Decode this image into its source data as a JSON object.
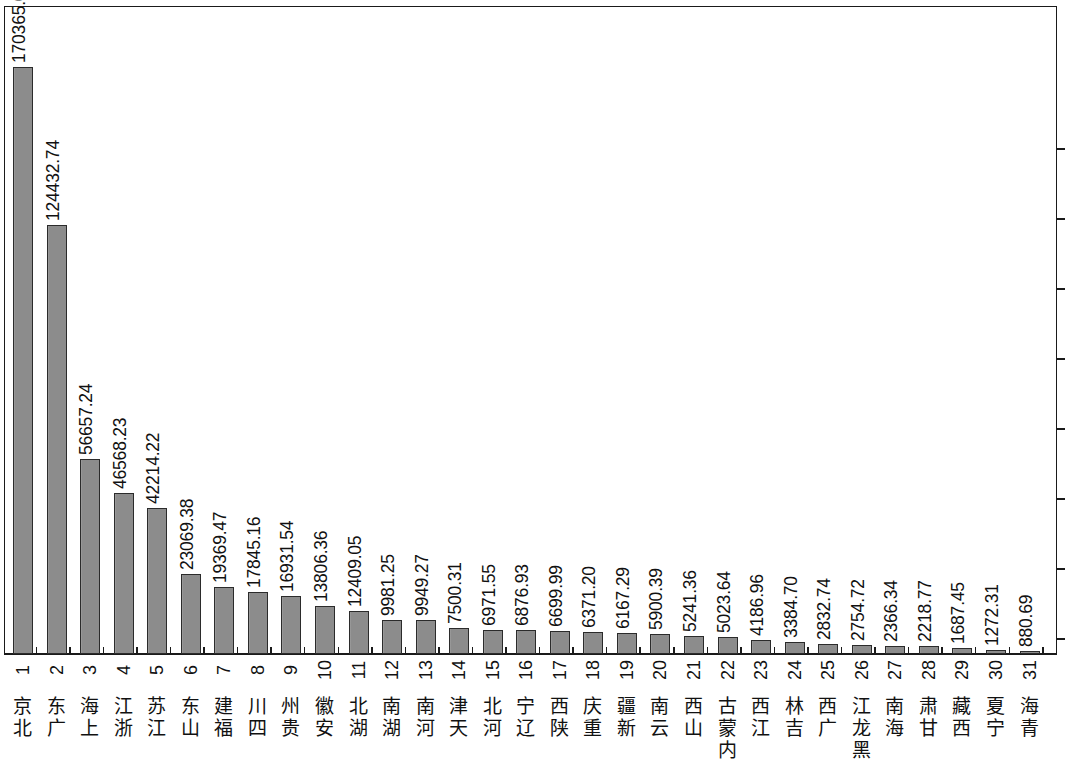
{
  "chart_data": {
    "type": "bar",
    "title": "",
    "subtitle": "",
    "xlabel": "",
    "ylabel": "",
    "grid": false,
    "legend": null,
    "orientation": "vertical",
    "value_label_rotation": -90,
    "x_tick_label_rotation": -90,
    "ylim": [
      0,
      181000
    ],
    "bar_color": "#8c8c8c",
    "bar_edge_color": "#2b2b2b",
    "axis_color": "#1a1a1a",
    "indices": [
      1,
      2,
      3,
      4,
      5,
      6,
      7,
      8,
      9,
      10,
      11,
      12,
      13,
      14,
      15,
      16,
      17,
      18,
      19,
      20,
      21,
      22,
      23,
      24,
      25,
      26,
      27,
      28,
      29,
      30,
      31
    ],
    "categories": [
      "北京",
      "广东",
      "上海",
      "浙江",
      "江苏",
      "山东",
      "福建",
      "四川",
      "贵州",
      "安徽",
      "湖北",
      "湖南",
      "河南",
      "天津",
      "河北",
      "辽宁",
      "陕西",
      "重庆",
      "新疆",
      "云南",
      "山西",
      "内蒙古",
      "江西",
      "吉林",
      "广西",
      "黑龙江",
      "海南",
      "甘肃",
      "西藏",
      "宁夏",
      "青海"
    ],
    "values": [
      170365.02,
      124432.74,
      56657.24,
      46568.23,
      42214.22,
      23069.38,
      19369.47,
      17845.16,
      16931.54,
      13806.36,
      12409.05,
      9981.25,
      9949.27,
      7500.31,
      6971.55,
      6876.93,
      6699.99,
      6371.2,
      6167.29,
      5900.39,
      5241.36,
      5023.64,
      4186.96,
      3384.7,
      2832.74,
      2754.72,
      2366.34,
      2218.77,
      1687.45,
      1272.31,
      880.69
    ],
    "value_labels": [
      "170365.02",
      "124432.74",
      "56657.24",
      "46568.23",
      "42214.22",
      "23069.38",
      "19369.47",
      "17845.16",
      "16931.54",
      "13806.36",
      "12409.05",
      "9981.25",
      "9949.27",
      "7500.31",
      "6971.55",
      "6876.93",
      "6699.99",
      "6371.20",
      "6167.29",
      "5900.39",
      "5241.36",
      "5023.64",
      "4186.96",
      "3384.70",
      "2832.74",
      "2754.72",
      "2366.34",
      "2218.77",
      "1687.45",
      "1272.31",
      "880.69"
    ]
  }
}
